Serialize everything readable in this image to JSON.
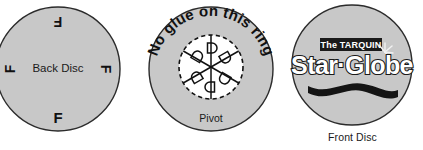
{
  "figure": {
    "background_color": "#ffffff",
    "disc_fill": "#c8c8c8",
    "disc_stroke": "#2b2b2b",
    "ink_color": "#1a1a1a"
  },
  "discs": [
    {
      "id": "back-disc",
      "name": "Back Disc",
      "center_label": "Back Disc",
      "orientation_marks": [
        {
          "letter": "F",
          "position": "top",
          "rotation_deg": 180
        },
        {
          "letter": "F",
          "position": "right",
          "rotation_deg": 90
        },
        {
          "letter": "F",
          "position": "left",
          "rotation_deg": 270
        },
        {
          "letter": "F",
          "position": "bottom",
          "rotation_deg": 0
        }
      ]
    },
    {
      "id": "pivot-disc",
      "name": "Pivot",
      "ring_text": "No glue on this ring",
      "caption": "Pivot",
      "inner_ring": {
        "style": "dashed",
        "segments": 6,
        "segment_marks": [
          "D",
          "D",
          "D",
          "D",
          "D",
          "D"
        ]
      }
    },
    {
      "id": "front-disc",
      "name": "Front Disc",
      "caption": "Front Disc",
      "logo": {
        "banner_text": "The TARQUIN",
        "banner_bg": "#1a1a1a",
        "banner_fg": "#ffffff",
        "wordmark": "Star·Globe",
        "wordmark_fill": "#ffffff",
        "wordmark_stroke": "#1a1a1a",
        "sparkle": "starburst-sparkle",
        "swoosh": "dark-wave-swoosh"
      }
    }
  ]
}
